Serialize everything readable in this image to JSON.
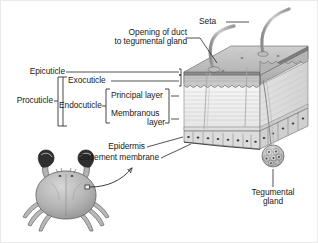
{
  "figure": {
    "background_color": "#ffffff",
    "ink_color": "#1a1a1a",
    "width": 318,
    "height": 243
  },
  "labels": {
    "seta": "Seta",
    "opening_of_duct_line1": "Opening of duct",
    "opening_of_duct_line2": "to tegumental gland",
    "epicuticle": "Epicuticle",
    "procuticle": "Procuticle",
    "exocuticle": "Exocuticle",
    "endocuticle": "Endocuticle",
    "principal_layer": "Principal layer",
    "membranous_line1": "Membranous",
    "membranous_line2": "layer",
    "epidermis": "Epidermis",
    "basement_membrane": "Basement membrane",
    "tegumental_line1": "Tegumental",
    "tegumental_line2": "gland"
  },
  "structures": {
    "block": "cuticle-block-cutaway",
    "setae_count": 2,
    "epidermal_cells": "columnar-cell-row",
    "tegumental_gland": "rosette-gland-cluster",
    "organism": "crab-habitus"
  },
  "colors": {
    "line": "#1a1a1a",
    "leader": "#222222",
    "cuticle_top": "#b8b8b8",
    "cuticle_light": "#f3f3f3",
    "exocuticle_band": "#9a9a9a",
    "epidermis_fill": "#dcdcdc",
    "seta": "#bdbdbd",
    "crab_body": "#b5b5b5",
    "crab_claw_tip": "#2b2b2b"
  }
}
